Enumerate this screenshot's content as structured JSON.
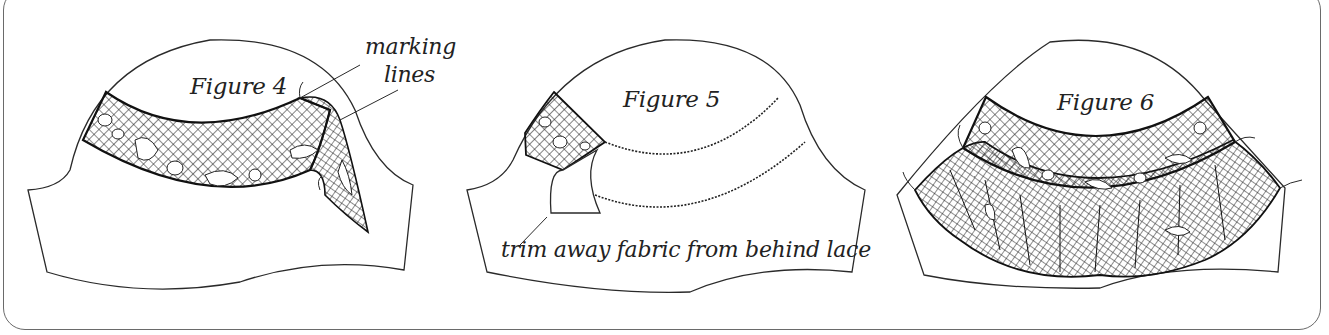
{
  "figures": [
    {
      "id": "figure-4",
      "title": "Figure 4",
      "annotations": [
        {
          "text": "marking",
          "role": "callout-line-1"
        },
        {
          "text": "lines",
          "role": "callout-line-2"
        }
      ],
      "depicts": "lace band pinned along curved marking lines on sleeve cap, loose end overlapping edge"
    },
    {
      "id": "figure-5",
      "title": "Figure 5",
      "annotations": [
        {
          "text": "trim away fabric from behind lace",
          "role": "callout"
        }
      ],
      "depicts": "zigzag-stitched lace edges with fabric being trimmed from behind"
    },
    {
      "id": "figure-6",
      "title": "Figure 6",
      "annotations": [],
      "depicts": "finished lace insertion band with gathered lace ruffle attached below"
    }
  ],
  "style": {
    "line_color": "#2a2a2a",
    "frame_color": "#6a6a6a",
    "background": "#ffffff"
  }
}
